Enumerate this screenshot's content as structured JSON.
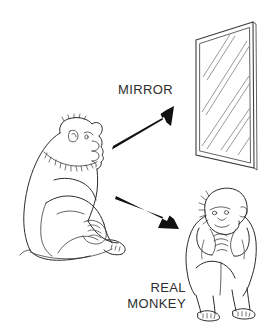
{
  "figure": {
    "background_color": "#ffffff",
    "ink_color": "#2b2b2b",
    "arrow_color": "#111111",
    "mirror_shine_color": "#8e8e8e",
    "width": 271,
    "height": 335
  },
  "labels": {
    "mirror": "MIRROR",
    "real_line1": "REAL",
    "real_line2": "MONKEY"
  },
  "elements": {
    "observer_monkey": "seated monkey in left profile facing right",
    "mirror_panel": "upright rectangular mirror shown in perspective with diagonal shine lines",
    "real_monkey": "smaller crouching monkey facing forward with hands raised to mouth",
    "arrow_to_mirror": "black arrow pointing up-right toward the mirror",
    "arrow_to_monkey": "black arrow pointing down-right toward the real monkey"
  }
}
